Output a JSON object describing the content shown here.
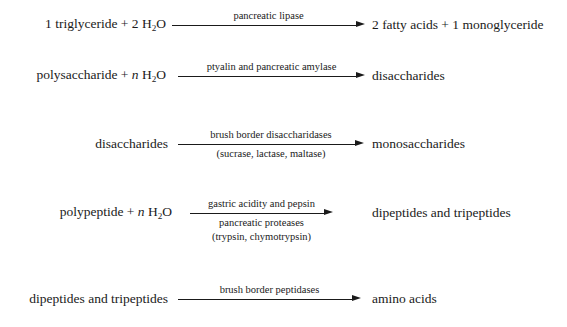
{
  "diagram": {
    "text_color": "#1a1a1a",
    "background_color": "#ffffff",
    "reactions": [
      {
        "id": "triglyceride-hydrolysis",
        "reactant_pre": "1 triglyceride + 2 H",
        "reactant_sub": "2",
        "reactant_post": "O",
        "product": "2 fatty acids + 1 monoglyceride",
        "label_above": "pancreatic lipase",
        "label_below_lines": []
      },
      {
        "id": "polysaccharide-hydrolysis",
        "reactant_pre": "polysaccharide + ",
        "reactant_italic": "n",
        "reactant_mid": " H",
        "reactant_sub": "2",
        "reactant_post": "O",
        "product": "disaccharides",
        "label_above": "ptyalin and pancreatic amylase",
        "label_below_lines": []
      },
      {
        "id": "disaccharide-hydrolysis",
        "reactant_pre": "disaccharides",
        "product": "monosaccharides",
        "label_above": "brush border disaccharidases",
        "label_below_lines": [
          "(sucrase, lactase, maltase)"
        ]
      },
      {
        "id": "polypeptide-hydrolysis",
        "reactant_pre": "polypeptide + ",
        "reactant_italic": "n",
        "reactant_mid": " H",
        "reactant_sub": "2",
        "reactant_post": "O",
        "product": "dipeptides and tripeptides",
        "label_above": "gastric acidity and pepsin",
        "label_below_lines": [
          "pancreatic proteases",
          "(trypsin, chymotrypsin)"
        ]
      },
      {
        "id": "peptide-hydrolysis",
        "reactant_pre": "dipeptides and tripeptides",
        "product": "amino acids",
        "label_above": "brush border peptidases",
        "label_below_lines": []
      }
    ]
  }
}
